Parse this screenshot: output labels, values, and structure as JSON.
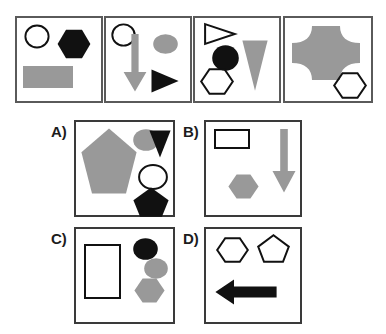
{
  "puzzle": {
    "title": "Visual analogy shape sequence puzzle",
    "colors": {
      "gray_fill": "#999999",
      "black_fill": "#111111",
      "outline_stroke": "#111111",
      "panel_border": "#5a5a5a",
      "option_panel_border": "#3a3a3a",
      "background": "#ffffff"
    },
    "sequence": {
      "name": "sequence-row",
      "panels": [
        {
          "id": "sequence-panel-1",
          "position": 1,
          "shapes": [
            {
              "name": "circle-outline",
              "shape": "circle",
              "fill": "none",
              "stroke": "#111111",
              "label": "white circle outline"
            },
            {
              "name": "hexagon-black",
              "shape": "hexagon",
              "fill": "#111111",
              "stroke": "none",
              "label": "black hexagon"
            },
            {
              "name": "rectangle-gray",
              "shape": "rectangle",
              "fill": "#999999",
              "stroke": "none",
              "label": "gray rectangle"
            }
          ]
        },
        {
          "id": "sequence-panel-2",
          "position": 2,
          "shapes": [
            {
              "name": "circle-outline",
              "shape": "circle",
              "fill": "none",
              "stroke": "#111111",
              "label": "white circle outline"
            },
            {
              "name": "arrow-down-gray",
              "shape": "arrow-down",
              "fill": "#999999",
              "stroke": "none",
              "label": "gray down arrow"
            },
            {
              "name": "ellipse-gray",
              "shape": "ellipse",
              "fill": "#999999",
              "stroke": "none",
              "label": "gray ellipse"
            },
            {
              "name": "triangle-right-black",
              "shape": "triangle-right",
              "fill": "#111111",
              "stroke": "none",
              "label": "black right triangle"
            }
          ]
        },
        {
          "id": "sequence-panel-3",
          "position": 3,
          "shapes": [
            {
              "name": "triangle-right-outline",
              "shape": "triangle-right",
              "fill": "none",
              "stroke": "#111111",
              "label": "white right triangle outline"
            },
            {
              "name": "circle-black",
              "shape": "circle",
              "fill": "#111111",
              "stroke": "none",
              "label": "black circle"
            },
            {
              "name": "hexagon-outline",
              "shape": "hexagon",
              "fill": "none",
              "stroke": "#111111",
              "label": "white hexagon outline"
            },
            {
              "name": "triangle-down-gray",
              "shape": "triangle-down",
              "fill": "#999999",
              "stroke": "none",
              "label": "gray down triangle"
            }
          ]
        },
        {
          "id": "sequence-panel-4",
          "position": 4,
          "shapes": [
            {
              "name": "cross-blob-gray",
              "shape": "cross-blob",
              "fill": "#999999",
              "stroke": "none",
              "label": "large gray cross blob"
            },
            {
              "name": "hexagon-outline",
              "shape": "hexagon",
              "fill": "none",
              "stroke": "#111111",
              "label": "white hexagon outline"
            }
          ]
        }
      ]
    },
    "options": [
      {
        "id": "option-a",
        "label": "A)",
        "letter": "A",
        "shapes": [
          {
            "name": "pentagon-gray-large",
            "shape": "pentagon",
            "fill": "#999999",
            "stroke": "none",
            "label": "large gray pentagon"
          },
          {
            "name": "ellipse-gray",
            "shape": "ellipse",
            "fill": "#999999",
            "stroke": "none",
            "label": "gray ellipse"
          },
          {
            "name": "triangle-down-black",
            "shape": "triangle-down",
            "fill": "#111111",
            "stroke": "none",
            "label": "black down triangle"
          },
          {
            "name": "circle-outline",
            "shape": "circle",
            "fill": "none",
            "stroke": "#111111",
            "label": "white circle outline"
          },
          {
            "name": "pentagon-black",
            "shape": "pentagon",
            "fill": "#111111",
            "stroke": "none",
            "label": "black pentagon"
          }
        ]
      },
      {
        "id": "option-b",
        "label": "B)",
        "letter": "B",
        "shapes": [
          {
            "name": "rectangle-outline",
            "shape": "rectangle",
            "fill": "none",
            "stroke": "#111111",
            "label": "white rectangle outline"
          },
          {
            "name": "hexagon-gray",
            "shape": "hexagon",
            "fill": "#999999",
            "stroke": "none",
            "label": "gray hexagon"
          },
          {
            "name": "arrow-down-gray",
            "shape": "arrow-down",
            "fill": "#999999",
            "stroke": "none",
            "label": "gray down arrow"
          }
        ]
      },
      {
        "id": "option-c",
        "label": "C)",
        "letter": "C",
        "shapes": [
          {
            "name": "rectangle-outline-tall",
            "shape": "rectangle",
            "fill": "none",
            "stroke": "#111111",
            "label": "white tall rectangle outline"
          },
          {
            "name": "circle-black",
            "shape": "circle",
            "fill": "#111111",
            "stroke": "none",
            "label": "black circle"
          },
          {
            "name": "ellipse-gray",
            "shape": "ellipse",
            "fill": "#999999",
            "stroke": "none",
            "label": "gray ellipse"
          },
          {
            "name": "hexagon-gray",
            "shape": "hexagon",
            "fill": "#999999",
            "stroke": "none",
            "label": "gray hexagon"
          }
        ]
      },
      {
        "id": "option-d",
        "label": "D)",
        "letter": "D",
        "shapes": [
          {
            "name": "hexagon-outline",
            "shape": "hexagon",
            "fill": "none",
            "stroke": "#111111",
            "label": "white hexagon outline"
          },
          {
            "name": "pentagon-outline",
            "shape": "pentagon",
            "fill": "none",
            "stroke": "#111111",
            "label": "white pentagon outline"
          },
          {
            "name": "arrow-left-black",
            "shape": "arrow-left",
            "fill": "#111111",
            "stroke": "none",
            "label": "black left arrow"
          }
        ]
      }
    ]
  }
}
